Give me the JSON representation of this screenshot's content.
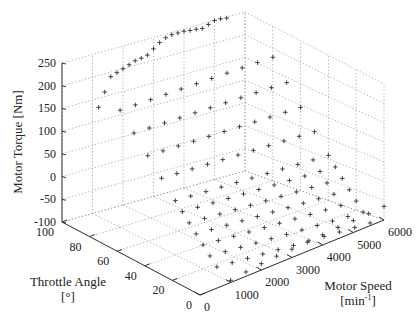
{
  "chart_data": {
    "type": "scatter",
    "title": "",
    "xlabel": "Motor Speed [min-1]",
    "ylabel": "Throttle Angle [°]",
    "zlabel": "Motor Torque [Nm]",
    "x_label_line1": "Motor Speed",
    "x_label_line2": "[min",
    "x_label_sup": "-1",
    "x_label_close": "]",
    "y_label_line1": "Throttle Angle",
    "y_label_line2": "[°]",
    "z_label": "Motor Torque [Nm]",
    "xlim": [
      0,
      6000
    ],
    "ylim": [
      0,
      100
    ],
    "zlim": [
      -100,
      250
    ],
    "x_ticks": [
      0,
      1000,
      2000,
      3000,
      4000,
      5000,
      6000
    ],
    "y_ticks": [
      0,
      20,
      40,
      60,
      80,
      100
    ],
    "z_ticks": [
      -100,
      -50,
      0,
      50,
      100,
      150,
      200,
      250
    ],
    "grid": true,
    "marker": "+",
    "series": [
      {
        "name": "full-load curve",
        "points": [
          [
            1200,
            100,
            130
          ],
          [
            1400,
            100,
            160
          ],
          [
            1600,
            100,
            190
          ],
          [
            1800,
            100,
            195
          ],
          [
            2000,
            100,
            200
          ],
          [
            2200,
            100,
            205
          ],
          [
            2400,
            100,
            210
          ],
          [
            2600,
            100,
            212
          ],
          [
            2800,
            100,
            215
          ],
          [
            3000,
            100,
            225
          ],
          [
            3200,
            100,
            235
          ],
          [
            3400,
            100,
            242
          ],
          [
            3600,
            100,
            245
          ],
          [
            3800,
            100,
            245
          ],
          [
            4000,
            100,
            245
          ],
          [
            4200,
            100,
            243
          ],
          [
            4400,
            100,
            242
          ],
          [
            4600,
            100,
            240
          ],
          [
            4800,
            100,
            245
          ],
          [
            5000,
            100,
            250
          ],
          [
            5200,
            100,
            250
          ],
          [
            5400,
            100,
            248
          ]
        ]
      },
      {
        "name": "part-load map",
        "speeds": [
          1000,
          1500,
          2000,
          2500,
          3000,
          3500,
          4000,
          4500,
          5000,
          5500,
          6000
        ],
        "throttles": [
          10,
          15,
          20,
          25,
          30,
          35,
          40,
          50,
          60,
          70,
          80
        ],
        "torque_min": -100,
        "torque_max": 200
      },
      {
        "name": "motoring (zero throttle)",
        "points": [
          [
            1000,
            0,
            -95
          ],
          [
            1500,
            0,
            -90
          ],
          [
            2000,
            0,
            -85
          ],
          [
            2500,
            0,
            -82
          ],
          [
            3000,
            0,
            -80
          ],
          [
            3500,
            0,
            -78
          ],
          [
            4000,
            0,
            -75
          ],
          [
            4500,
            0,
            -72
          ],
          [
            5000,
            0,
            -70
          ],
          [
            5500,
            0,
            -68
          ],
          [
            6000,
            0,
            -65
          ]
        ]
      }
    ]
  }
}
